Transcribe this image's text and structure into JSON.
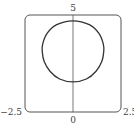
{
  "chart_data": {
    "type": "line",
    "title": "",
    "xlabel": "",
    "ylabel": "",
    "xlim": [
      -2.5,
      2.5
    ],
    "ylim": [
      0,
      5
    ],
    "grid": false,
    "legend": null,
    "tick_labels": {
      "x_min": "−2.5",
      "x_max": "2.5",
      "y_min": "0",
      "y_max": "5"
    },
    "series": [
      {
        "name": "closed curve",
        "description": "rounded-square closed curve centered on the y-axis",
        "x": [
          0,
          0.85,
          1.35,
          1.58,
          1.6,
          1.5,
          1.2,
          0.7,
          0,
          -0.7,
          -1.2,
          -1.5,
          -1.6,
          -1.58,
          -1.35,
          -0.85,
          0
        ],
        "y": [
          4.7,
          4.5,
          4.05,
          3.5,
          3.1,
          2.6,
          2.1,
          1.7,
          1.55,
          1.7,
          2.1,
          2.6,
          3.1,
          3.5,
          4.05,
          4.5,
          4.7
        ]
      }
    ]
  }
}
